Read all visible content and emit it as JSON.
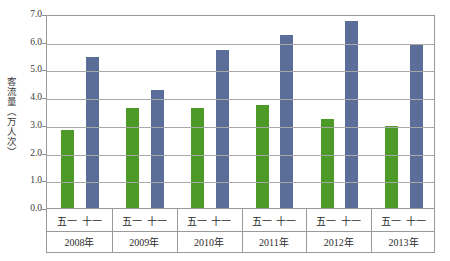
{
  "chart_data": {
    "type": "bar",
    "title": "",
    "xlabel": "",
    "ylabel": "客流量（万人次）",
    "ylim": [
      0.0,
      7.0
    ],
    "ytick_step": 1.0,
    "ytick_labels": [
      "7.0",
      "6.0",
      "5.0",
      "4.0",
      "3.0",
      "2.0",
      "1.0",
      "0.0"
    ],
    "ytick_values": [
      7.0,
      6.0,
      5.0,
      4.0,
      3.0,
      2.0,
      1.0,
      0.0
    ],
    "grid": true,
    "legend": "none",
    "categories": [
      "2008年",
      "2009年",
      "2010年",
      "2011年",
      "2012年",
      "2013年"
    ],
    "subcategories": [
      "五一",
      "十一"
    ],
    "series": [
      {
        "name": "五一",
        "color": "#4e9a28",
        "values": [
          2.8,
          3.6,
          3.6,
          3.7,
          3.2,
          2.95
        ]
      },
      {
        "name": "十一",
        "color": "#5b6e99",
        "values": [
          5.45,
          4.25,
          5.7,
          6.25,
          6.75,
          5.9
        ]
      }
    ],
    "groups": [
      {
        "year": "2008年",
        "may": 2.8,
        "oct": 5.45
      },
      {
        "year": "2009年",
        "may": 3.6,
        "oct": 4.25
      },
      {
        "year": "2010年",
        "may": 3.6,
        "oct": 5.7
      },
      {
        "year": "2011年",
        "may": 3.7,
        "oct": 6.25
      },
      {
        "year": "2012年",
        "may": 3.2,
        "oct": 6.75
      },
      {
        "year": "2013年",
        "may": 2.95,
        "oct": 5.9
      }
    ]
  },
  "axis": {
    "y_title": "客流量（万人次）",
    "ticks": [
      "7.0",
      "6.0",
      "5.0",
      "4.0",
      "3.0",
      "2.0",
      "1.0",
      "0.0"
    ]
  },
  "xlabels": {
    "periods": [
      "五一",
      "十一",
      "五一",
      "十一",
      "五一",
      "十一",
      "五一",
      "十一",
      "五一",
      "十一",
      "五一",
      "十一"
    ],
    "years": [
      "2008年",
      "2009年",
      "2010年",
      "2011年",
      "2012年",
      "2013年"
    ]
  },
  "colors": {
    "may_bar": "#4e9a28",
    "oct_bar": "#5b6e99",
    "grid": "#a8a8a8",
    "frame": "#9a9a9a",
    "text": "#2b2b2b"
  }
}
